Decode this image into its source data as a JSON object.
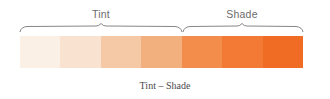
{
  "groups": [
    {
      "label": "Tint",
      "center_x": 101
    },
    {
      "label": "Shade",
      "center_x": 242
    }
  ],
  "swatches": [
    {
      "name": "tint-1",
      "color": "#fbf0e6"
    },
    {
      "name": "tint-2",
      "color": "#f9e2cf"
    },
    {
      "name": "tint-3",
      "color": "#f6c9a6"
    },
    {
      "name": "tint-4",
      "color": "#f3b07f"
    },
    {
      "name": "shade-1",
      "color": "#f38d4c"
    },
    {
      "name": "shade-2",
      "color": "#f27a35"
    },
    {
      "name": "shade-3",
      "color": "#f06c24"
    }
  ],
  "caption": "Tint – Shade",
  "colors": {
    "brace": "#777777",
    "label": "#6b6b6b",
    "caption": "#4a4a4a"
  }
}
